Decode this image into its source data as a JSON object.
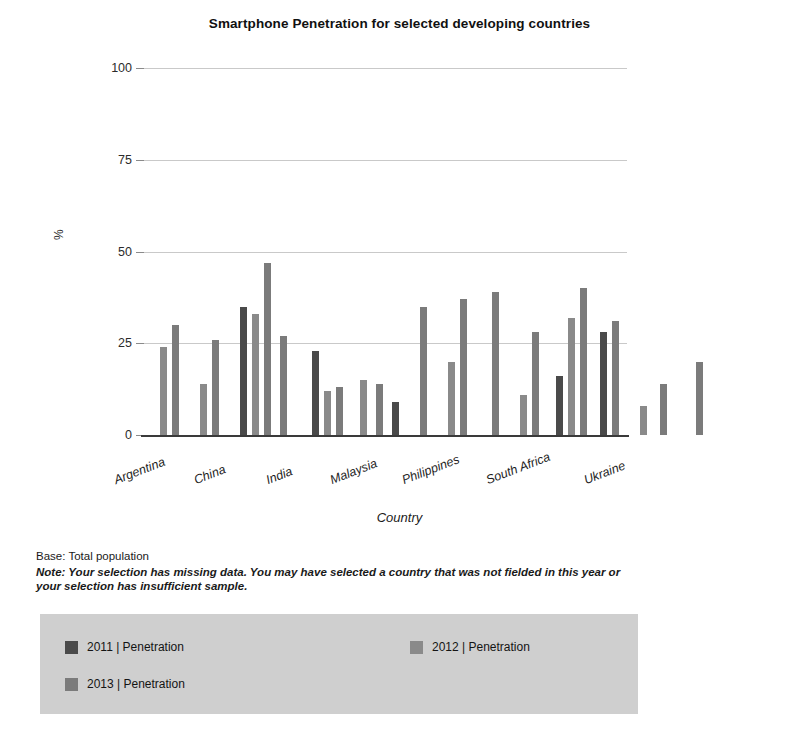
{
  "title": "Smartphone Penetration for selected developing countries",
  "footnotes": {
    "base": "Base: Total population",
    "note": "Note: Your selection has missing data. You may have selected a country that was not fielded in this year or your selection has insufficient sample."
  },
  "legend": {
    "items": [
      {
        "label": "2011 | Penetration",
        "color": "#4a4a4a"
      },
      {
        "label": "2012 | Penetration",
        "color": "#8a8a8a"
      },
      {
        "label": "2013 | Penetration",
        "color": "#7b7b7b"
      }
    ]
  },
  "chart_data": {
    "type": "bar",
    "title": "Smartphone Penetration for selected developing countries",
    "xlabel": "Country",
    "ylabel": "%",
    "ylim": [
      0,
      100
    ],
    "yticks": [
      0,
      25,
      50,
      75,
      100
    ],
    "grid": true,
    "legend_position": "bottom",
    "categories": [
      "Argentina",
      "China",
      "India",
      "Malaysia",
      "Philippines",
      "South Africa",
      "Ukraine"
    ],
    "series": [
      {
        "name": "2011 | Penetration",
        "color": "#4a4a4a",
        "values": [
          null,
          35,
          23,
          9,
          null,
          16,
          28
        ]
      },
      {
        "name": "2012 | Penetration",
        "color": "#8a8a8a",
        "values": [
          24,
          33,
          12,
          15,
          20,
          11,
          8
        ]
      },
      {
        "name": "2013 | Penetration",
        "color": "#7b7b7b",
        "values": [
          30,
          47,
          13,
          14,
          37,
          40,
          20
        ]
      }
    ],
    "bars": [
      {
        "country": "Argentina",
        "year": "2012",
        "value": 24,
        "x": 17,
        "color": "#8a8a8a"
      },
      {
        "country": "Argentina",
        "year": "2013",
        "value": 30,
        "x": 29,
        "color": "#7b7b7b"
      },
      {
        "country": "Argentina",
        "year": "2012",
        "value": 14,
        "x": 57,
        "color": "#8a8a8a"
      },
      {
        "country": "Argentina",
        "year": "2013",
        "value": 26,
        "x": 69,
        "color": "#7b7b7b"
      },
      {
        "country": "China",
        "year": "2011",
        "value": 35,
        "x": 97,
        "color": "#4a4a4a"
      },
      {
        "country": "China",
        "year": "2012",
        "value": 33,
        "x": 109,
        "color": "#8a8a8a"
      },
      {
        "country": "China",
        "year": "2013",
        "value": 47,
        "x": 121,
        "color": "#7b7b7b"
      },
      {
        "country": "China",
        "year": "2013",
        "value": 27,
        "x": 137,
        "color": "#7b7b7b"
      },
      {
        "country": "India",
        "year": "2011",
        "value": 23,
        "x": 169,
        "color": "#4a4a4a"
      },
      {
        "country": "India",
        "year": "2012",
        "value": 12,
        "x": 181,
        "color": "#8a8a8a"
      },
      {
        "country": "India",
        "year": "2013",
        "value": 13,
        "x": 193,
        "color": "#7b7b7b"
      },
      {
        "country": "India",
        "year": "2012",
        "value": 15,
        "x": 217,
        "color": "#8a8a8a"
      },
      {
        "country": "Malaysia",
        "year": "2013",
        "value": 14,
        "x": 233,
        "color": "#7b7b7b"
      },
      {
        "country": "Malaysia",
        "year": "2011",
        "value": 9,
        "x": 249,
        "color": "#4a4a4a"
      },
      {
        "country": "Malaysia",
        "year": "2013",
        "value": 35,
        "x": 277,
        "color": "#7b7b7b"
      },
      {
        "country": "Philippines",
        "year": "2012",
        "value": 20,
        "x": 305,
        "color": "#8a8a8a"
      },
      {
        "country": "Philippines",
        "year": "2013",
        "value": 37,
        "x": 317,
        "color": "#7b7b7b"
      },
      {
        "country": "Philippines",
        "year": "2013",
        "value": 39,
        "x": 349,
        "color": "#7b7b7b"
      },
      {
        "country": "South Africa",
        "year": "2012",
        "value": 11,
        "x": 377,
        "color": "#8a8a8a"
      },
      {
        "country": "South Africa",
        "year": "2013",
        "value": 28,
        "x": 389,
        "color": "#7b7b7b"
      },
      {
        "country": "South Africa",
        "year": "2011",
        "value": 16,
        "x": 413,
        "color": "#4a4a4a"
      },
      {
        "country": "South Africa",
        "year": "2012",
        "value": 32,
        "x": 425,
        "color": "#8a8a8a"
      },
      {
        "country": "South Africa",
        "year": "2013",
        "value": 40,
        "x": 437,
        "color": "#7b7b7b"
      },
      {
        "country": "Ukraine",
        "year": "2011",
        "value": 28,
        "x": 457,
        "color": "#4a4a4a"
      },
      {
        "country": "Ukraine",
        "year": "2013",
        "value": 31,
        "x": 469,
        "color": "#7b7b7b"
      },
      {
        "country": "Ukraine",
        "year": "2012",
        "value": 8,
        "x": 497,
        "color": "#8a8a8a"
      },
      {
        "country": "Ukraine",
        "year": "2013",
        "value": 14,
        "x": 517,
        "color": "#7b7b7b"
      },
      {
        "country": "Ukraine",
        "year": "2013",
        "value": 20,
        "x": 553,
        "color": "#7b7b7b"
      }
    ],
    "xtick_positions": [
      {
        "label": "Argentina",
        "x": 17
      },
      {
        "label": "China",
        "x": 97
      },
      {
        "label": "India",
        "x": 169
      },
      {
        "label": "Malaysia",
        "x": 233
      },
      {
        "label": "Philippines",
        "x": 305
      },
      {
        "label": "South Africa",
        "x": 389
      },
      {
        "label": "Ukraine",
        "x": 487
      }
    ]
  }
}
